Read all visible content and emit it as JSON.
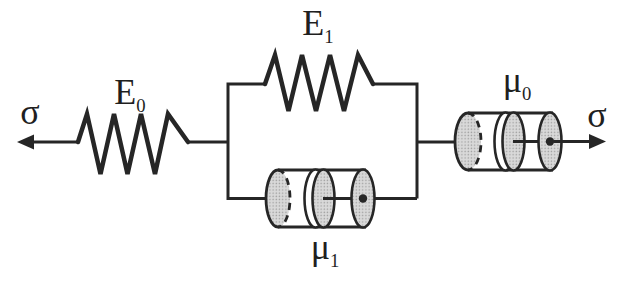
{
  "labels": {
    "sigma_left": "σ",
    "sigma_right": "σ",
    "E0": {
      "base": "E",
      "sub": "0"
    },
    "E1": {
      "base": "E",
      "sub": "1"
    },
    "mu0": {
      "base": "μ",
      "sub": "0"
    },
    "mu1": {
      "base": "μ",
      "sub": "1"
    }
  },
  "colors": {
    "line": "#262626",
    "fill_light": "#d9d9d9",
    "fill_dot": "#9b9b9b",
    "background": "#ffffff"
  }
}
